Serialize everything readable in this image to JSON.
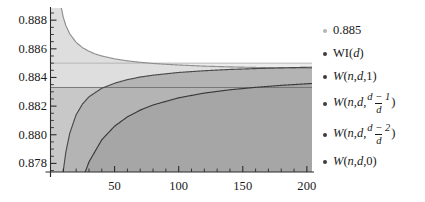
{
  "chart_data": {
    "type": "area",
    "title": "",
    "xlabel": "",
    "ylabel": "",
    "xlim": [
      0,
      204
    ],
    "ylim": [
      0.8774,
      0.88885
    ],
    "grid": false,
    "legend_position": "right",
    "xticks": [
      50,
      100,
      150,
      200
    ],
    "xtick_labels": [
      "50",
      "100",
      "150",
      "200"
    ],
    "yticks": [
      0.878,
      0.88,
      0.882,
      0.884,
      0.886,
      0.888
    ],
    "ytick_labels": [
      "0.878",
      "0.880",
      "0.882",
      "0.884",
      "0.886",
      "0.888"
    ],
    "x_minor_tick_step": 10,
    "y_minor_tick_step": 0.0005,
    "series": [
      {
        "name": "0.885",
        "kind": "constant-line",
        "value": 0.885,
        "color": "#b0b0b0",
        "fill": "#ececec",
        "x": [
          0,
          200
        ],
        "values": [
          0.885,
          0.885
        ]
      },
      {
        "name": "WI(d)",
        "kind": "curve",
        "color": "#8f8f8f",
        "fill": "#dedede",
        "x": [
          1,
          2,
          4,
          6,
          8,
          10,
          12,
          15,
          20,
          25,
          30,
          35,
          40,
          50,
          60,
          70,
          80,
          90,
          100,
          120,
          140,
          160,
          180,
          200
        ],
        "values": [
          0.904,
          0.8978,
          0.8928,
          0.8904,
          0.88905,
          0.8882,
          0.88762,
          0.88705,
          0.88645,
          0.88608,
          0.88583,
          0.88564,
          0.8855,
          0.8853,
          0.88516,
          0.88506,
          0.88498,
          0.88492,
          0.88487,
          0.88479,
          0.88474,
          0.8847,
          0.88467,
          0.88464
        ]
      },
      {
        "name": "W(n,d,1)",
        "kind": "constant-line",
        "value": 0.8833,
        "color": "#707070",
        "fill": "#c8c8c8",
        "x": [
          0,
          200
        ],
        "values": [
          0.8833,
          0.8833
        ]
      },
      {
        "name": "W(n,d,(d-1)/d)",
        "kind": "curve",
        "color": "#4a4a4a",
        "fill": "#b4b4b4",
        "x": [
          4,
          6,
          8,
          10,
          12,
          15,
          20,
          25,
          30,
          40,
          50,
          60,
          70,
          80,
          100,
          120,
          140,
          160,
          180,
          200
        ],
        "values": [
          0.869,
          0.8731,
          0.8757,
          0.8775,
          0.8788,
          0.8801,
          0.8814,
          0.88215,
          0.88265,
          0.88325,
          0.8836,
          0.88385,
          0.88403,
          0.88416,
          0.88435,
          0.88447,
          0.88456,
          0.88462,
          0.88467,
          0.88471
        ]
      },
      {
        "name": "W(n,d,(d-2)/d)",
        "kind": "curve",
        "color": "#3a3a3a",
        "fill": "#a6a6a6",
        "x": [
          10,
          12,
          15,
          20,
          25,
          30,
          40,
          50,
          60,
          70,
          80,
          100,
          120,
          140,
          160,
          180,
          200
        ],
        "values": [
          0.868,
          0.8701,
          0.8725,
          0.8752,
          0.8769,
          0.8781,
          0.87965,
          0.8806,
          0.88125,
          0.88172,
          0.88208,
          0.88258,
          0.88291,
          0.88314,
          0.88331,
          0.88345,
          0.88356
        ]
      },
      {
        "name": "W(n,d,0)",
        "kind": "region",
        "color": "#2e2e2e",
        "fill": "#9a9a9a",
        "x": [
          0,
          200
        ],
        "values": [
          0.8774,
          0.8774
        ]
      }
    ]
  },
  "legend": {
    "items": [
      {
        "id": "const-885",
        "bullet_color": "#b5b5b5",
        "type": "plain",
        "text": "0.885"
      },
      {
        "id": "wi-d",
        "bullet_color": "#3d3d3d",
        "type": "func_plain",
        "head": "WI(",
        "arg": "d",
        "tail": ")"
      },
      {
        "id": "w-n-d-1",
        "bullet_color": "#3d3d3d",
        "type": "func_plain",
        "head": "W",
        "prefix": "(",
        "a": "n",
        "b": "d",
        "third": "1",
        "tail": ")"
      },
      {
        "id": "w-n-d-dm1-over-d",
        "bullet_color": "#3d3d3d",
        "type": "func_frac",
        "head": "W",
        "a": "n",
        "b": "d",
        "numerator": "d − 1",
        "denominator": "d"
      },
      {
        "id": "w-n-d-dm2-over-d",
        "bullet_color": "#3d3d3d",
        "type": "func_frac",
        "head": "W",
        "a": "n",
        "b": "d",
        "numerator": "d − 2",
        "denominator": "d"
      },
      {
        "id": "w-n-d-0",
        "bullet_color": "#3d3d3d",
        "type": "func_plain",
        "head": "W",
        "prefix": "(",
        "a": "n",
        "b": "d",
        "third": "0",
        "tail": ")"
      }
    ]
  },
  "colors": {
    "axis": "#2b2b2b",
    "text": "#1a1a1a",
    "background": "#ffffff"
  }
}
